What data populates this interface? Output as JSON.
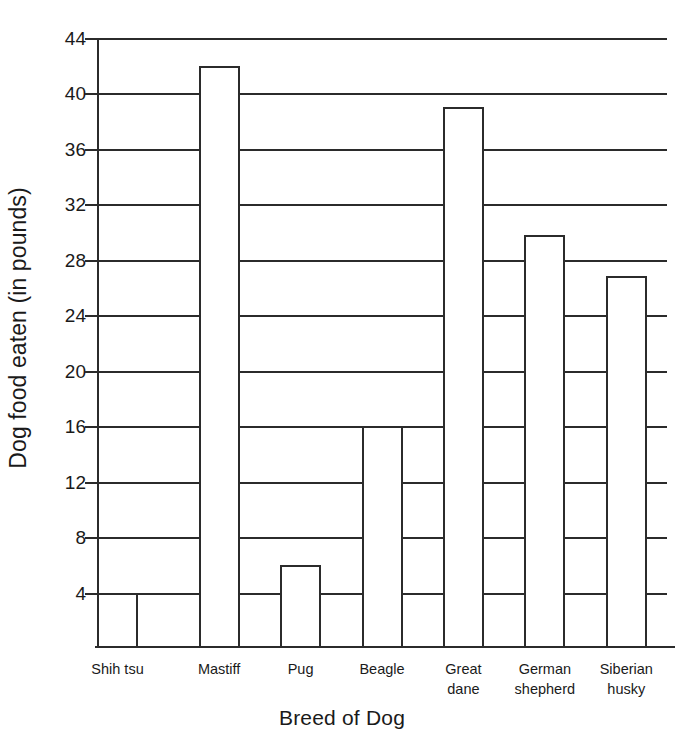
{
  "chart_data": {
    "type": "bar",
    "title": "",
    "xlabel": "Breed of Dog",
    "ylabel": "Dog food eaten (in pounds)",
    "categories": [
      "Shih tsu",
      "Mastiff",
      "Pug",
      "Beagle",
      "Great\ndane",
      "German\nshepherd",
      "Siberian\nhusky"
    ],
    "values": [
      4,
      42,
      6,
      16,
      39,
      29.8,
      26.8
    ],
    "ylim": [
      0,
      44
    ],
    "yticks": [
      4,
      8,
      12,
      16,
      20,
      24,
      28,
      32,
      36,
      40,
      44
    ],
    "ytick_labels": [
      "4",
      "8",
      "12",
      "16",
      "20",
      "24",
      "28",
      "32",
      "36",
      "40",
      "44"
    ],
    "grid": true,
    "legend": "none",
    "bar_fill": "#ffffff",
    "bar_edge": "#2b2b2b",
    "background": "#ffffff"
  }
}
